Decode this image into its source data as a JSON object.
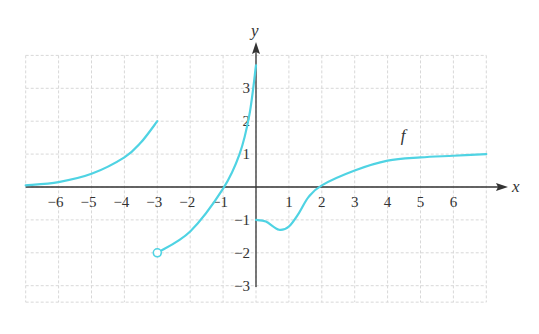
{
  "chart_data": {
    "type": "line",
    "title": "",
    "xlabel": "x",
    "ylabel": "y",
    "function_label": "f",
    "xlim": [
      -7,
      7
    ],
    "ylim": [
      -3.5,
      4
    ],
    "grid": true,
    "x_ticks": [
      -6,
      -5,
      -4,
      -3,
      -2,
      -1,
      1,
      2,
      3,
      4,
      5,
      6
    ],
    "y_ticks": [
      -3,
      -2,
      -1,
      1,
      2,
      3
    ],
    "curve_color": "#4fd3e3",
    "series": [
      {
        "name": "f piece 1",
        "x": [
          -7,
          -6,
          -5,
          -4,
          -3.5,
          -3
        ],
        "y": [
          0.05,
          0.15,
          0.4,
          0.9,
          1.35,
          2
        ],
        "right_endpoint": "closed (no marker)"
      },
      {
        "name": "f piece 2",
        "x": [
          -3,
          -2,
          -1,
          -0.5,
          -0.2,
          0
        ],
        "y": [
          -2,
          -1.35,
          -0.05,
          1,
          2.2,
          3.7
        ],
        "left_endpoint": "open circle at (-3, -2)",
        "right_behavior": "vertical asymptote at x=0 (increasing)"
      },
      {
        "name": "f piece 3",
        "x": [
          0,
          0.3,
          0.7,
          1,
          1.3,
          1.6,
          2,
          3,
          4,
          5,
          6,
          7
        ],
        "y": [
          -1,
          -1.05,
          -1.3,
          -1.2,
          -0.8,
          -0.3,
          0.05,
          0.5,
          0.8,
          0.9,
          0.95,
          1
        ],
        "left_endpoint": "(0, -1)",
        "note": "local minimum near x≈0.6, y≈-1.3; horizontal asymptote y=1"
      }
    ],
    "open_points": [
      {
        "x": -3,
        "y": -2
      }
    ]
  }
}
